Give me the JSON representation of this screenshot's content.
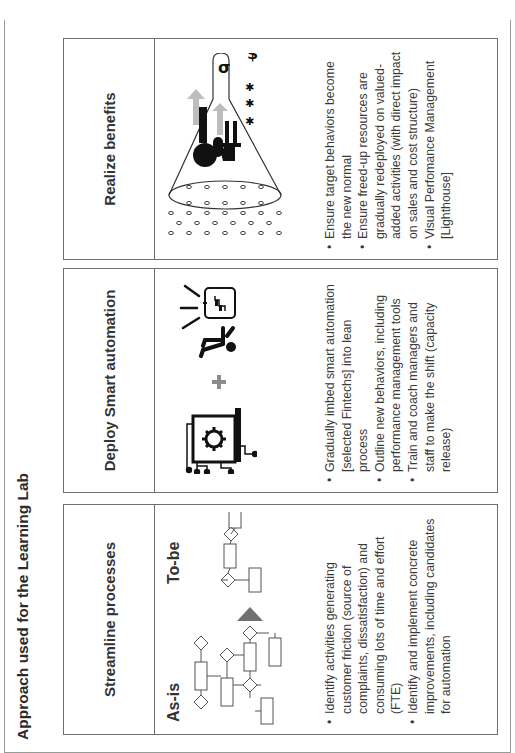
{
  "slide": {
    "title": "Approach used for the Learning Lab"
  },
  "columns": [
    {
      "heading": "Streamline processes",
      "visual": {
        "as_is_label": "As-is",
        "to_be_label": "To-be",
        "arrow_icon": "triangle-arrow-right",
        "arrow_color": "#707070"
      },
      "bullets": [
        "Identify activities generating customer friction (source of complaints, dissatisfaction) and consuming lots of time and effort (FTE)",
        "Identify and implement concrete improvements, including candidates for automation"
      ]
    },
    {
      "heading": "Deploy Smart automation",
      "visual": {
        "left_icon": "automation-gear-circuit-icon",
        "plus_icon": "plus-icon",
        "plus_color": "#8c8c8c",
        "right_icon": "presenter-board-icon"
      },
      "bullets": [
        "Gradually imbed smart automation [selected Fintechs] into lean process",
        "Outline new behaviors, including performance management tools",
        "Train and coach managers and staff to make the shift (capacity release)"
      ]
    },
    {
      "heading": "Realize benefits",
      "visual": {
        "icon": "funnel-growth-icon",
        "symbol_dollar": "$",
        "symbol_sigma": "σ",
        "arrow_color": "#bdbdbd"
      },
      "bullets": [
        "Ensure target behaviors become the new normal",
        "Ensure freed-up resources are gradually redeployed on valued-added activities (with direct impact on sales and cost structure)",
        "Visual Perfomance Management [Lighthouse]"
      ]
    }
  ]
}
